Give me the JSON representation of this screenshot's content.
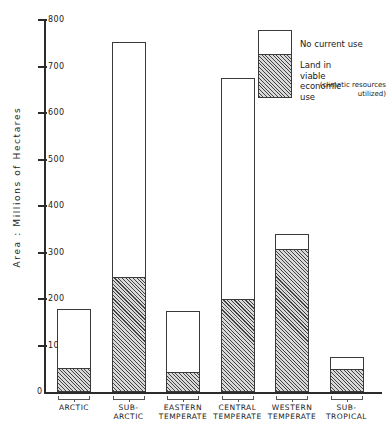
{
  "chart_data": {
    "type": "bar",
    "subtype": "stacked",
    "title": "",
    "xlabel": "",
    "ylabel": "Area : Millions of Hectares",
    "ylim": [
      0,
      800
    ],
    "ytick_values": [
      0,
      100,
      200,
      300,
      400,
      500,
      600,
      700,
      800
    ],
    "ytick_labels": [
      "0",
      "100",
      "200",
      "300",
      "400",
      "500",
      "600",
      "700",
      "800"
    ],
    "grid": false,
    "legend_position": "top-right",
    "categories": [
      "ARCTIC",
      "SUB-\nARCTIC",
      "EASTERN\nTEMPERATE",
      "CENTRAL\nTEMPERATE",
      "WESTERN\nTEMPERATE",
      "SUB-\nTROPICAL"
    ],
    "series": [
      {
        "name": "Land in viable economic use (climatic resources utilized)",
        "fill": "hatched",
        "values": [
          50,
          245,
          40,
          197,
          305,
          47
        ]
      },
      {
        "name": "No current use",
        "fill": "white",
        "values": [
          128,
          508,
          135,
          478,
          35,
          28
        ]
      }
    ],
    "totals": [
      178,
      753,
      175,
      675,
      340,
      75
    ],
    "legend": [
      {
        "label": "No current use",
        "fill": "white"
      },
      {
        "label": "Land in viable\neconomic use",
        "sub": "(climatic resources\nutilized)",
        "fill": "hatched"
      }
    ],
    "colors": {
      "axis": "#2b2b2b",
      "bar_outline": "#3a3a3a",
      "hatch": "#282828",
      "hatch_background": "#d9d9d9",
      "no_use_fill": "#ffffff",
      "text": "#1a1a1a"
    }
  }
}
